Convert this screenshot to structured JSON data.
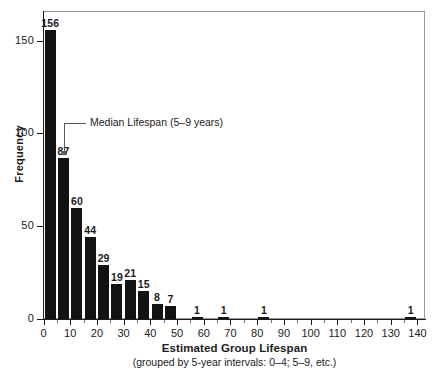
{
  "chart_data": {
    "type": "bar",
    "title": "",
    "xlabel": "Estimated Group Lifespan",
    "xlabel_sub": "(grouped by 5-year intervals: 0–4; 5–9, etc.)",
    "ylabel": "Frequency",
    "xlim": [
      0,
      143
    ],
    "ylim": [
      0,
      166
    ],
    "grid": false,
    "legend": "none",
    "bin_width": 5,
    "x_ticks": [
      0,
      10,
      20,
      30,
      40,
      50,
      60,
      70,
      80,
      90,
      100,
      110,
      120,
      130,
      140
    ],
    "x_tick_labels": [
      "0",
      "10",
      "20",
      "30",
      "40",
      "50",
      "60",
      "70",
      "80",
      "90",
      "100",
      "110",
      "120",
      "130",
      "140"
    ],
    "x_minor_ticks": [
      5,
      15,
      25,
      35,
      45,
      55,
      65,
      75,
      85,
      95,
      105,
      115,
      125,
      135
    ],
    "y_ticks": [
      0,
      50,
      100,
      150
    ],
    "y_tick_labels": [
      "0",
      "50",
      "100",
      "150"
    ],
    "bins": [
      {
        "start": 0,
        "end": 5,
        "label": "0–4",
        "value": 156,
        "value_label": "156"
      },
      {
        "start": 5,
        "end": 10,
        "label": "5–9",
        "value": 87,
        "value_label": "87"
      },
      {
        "start": 10,
        "end": 15,
        "label": "10–14",
        "value": 60,
        "value_label": "60"
      },
      {
        "start": 15,
        "end": 20,
        "label": "15–19",
        "value": 44,
        "value_label": "44"
      },
      {
        "start": 20,
        "end": 25,
        "label": "20–24",
        "value": 29,
        "value_label": "29"
      },
      {
        "start": 25,
        "end": 30,
        "label": "25–29",
        "value": 19,
        "value_label": "19"
      },
      {
        "start": 30,
        "end": 35,
        "label": "30–34",
        "value": 21,
        "value_label": "21"
      },
      {
        "start": 35,
        "end": 40,
        "label": "35–39",
        "value": 15,
        "value_label": "15"
      },
      {
        "start": 40,
        "end": 45,
        "label": "40–44",
        "value": 8,
        "value_label": "8"
      },
      {
        "start": 45,
        "end": 50,
        "label": "45–49",
        "value": 7,
        "value_label": "7"
      },
      {
        "start": 55,
        "end": 60,
        "label": "55–59",
        "value": 1,
        "value_label": "1"
      },
      {
        "start": 65,
        "end": 70,
        "label": "65–69",
        "value": 1,
        "value_label": "1"
      },
      {
        "start": 80,
        "end": 85,
        "label": "80–84",
        "value": 1,
        "value_label": "1"
      },
      {
        "start": 135,
        "end": 140,
        "label": "135–139",
        "value": 1,
        "value_label": "1"
      }
    ],
    "annotations": [
      {
        "text": "Median Lifespan (5–9 years)",
        "points_to_bin": "5–9",
        "style": "elbow-arrow-down"
      }
    ],
    "colors": {
      "bar": "#121212",
      "axis": "#1b1b1b",
      "frame": "#9a9a9a",
      "annotation": "#5a5a5a",
      "background": "#ffffff"
    }
  }
}
